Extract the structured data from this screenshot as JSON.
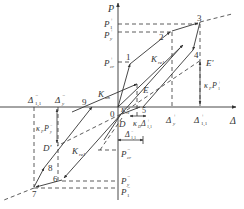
{
  "diagram": {
    "type": "hysteresis-loop",
    "axes": {
      "y_label": "P",
      "x_label": "Δ",
      "origin_label": "0"
    },
    "y_ticks": {
      "p1_pos": "P",
      "p1_pos_sup": "+",
      "p1_pos_sub": "1",
      "py_pos": "P",
      "py_pos_sup": "+",
      "py_pos_sub": "y",
      "pcr_pos": "P",
      "pcr_pos_sup": "+",
      "pcr_pos_sub": "cr",
      "pcr_neg": "P",
      "pcr_neg_sup": "−",
      "pcr_neg_sub": "cr",
      "py_neg": "P",
      "py_neg_sup": "−",
      "py_neg_sub": "y",
      "p1_neg": "P",
      "p1_neg_sup": "−",
      "p1_neg_sub": "1"
    },
    "x_ticks": {
      "dy_pos": "Δ",
      "dy_pos_sup": "+",
      "dy_pos_sub": "y",
      "d1_pos": "Δ",
      "d1_pos_sup": "+",
      "d1_pos_sub": "1,1",
      "dy_neg": "Δ",
      "dy_neg_sup": "−",
      "dy_neg_sub": "y",
      "d1_neg": "Δ",
      "d1_neg_sup": "−",
      "d1_neg_sub": "1,1"
    },
    "points": [
      "1",
      "2",
      "3",
      "4",
      "5",
      "6",
      "7",
      "8",
      "9"
    ],
    "special_points": {
      "E": "E",
      "E_prime": "E'",
      "D": "D",
      "D_prime": "D'"
    },
    "annotations": {
      "k_un_pos": "K",
      "k_un_pos_sub": "un",
      "k_re1_pos": "K",
      "k_re1_pos_sub": "re1",
      "k_re1_neg": "K",
      "k_re1_neg_sub": "re1",
      "k_re_small": "K",
      "k_re_small_sub": "re",
      "kappa_p_neg": "κ",
      "kappa_p_neg_sub": "P",
      "kappa_p_neg_P": "P",
      "kappa_p_neg_P_sub": "y",
      "kappa_p_neg_P_sup": "−",
      "kappa_p_pos": "κ",
      "kappa_p_pos_sub": "P",
      "kappa_p_pos_P": "P",
      "kappa_p_pos_P_sub": "1",
      "kappa_p_pos_P_sup": "+",
      "kappa_d": "κ",
      "kappa_d_sub": "D",
      "kappa_d_delta": "Δ",
      "kappa_d_delta_sub": "1,1",
      "kappa_d_delta_sup": "+",
      "delta_span": "Δ",
      "delta_span_sub": "1,1",
      "delta_span_sup": "−"
    },
    "colors": {
      "line": "#333333",
      "background": "#ffffff"
    }
  }
}
